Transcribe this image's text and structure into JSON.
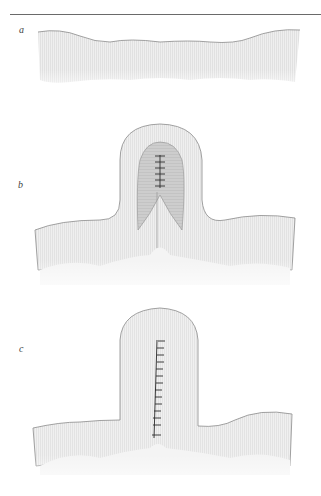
{
  "figure": {
    "panels": [
      {
        "label": "a",
        "description": "flat tissue layer"
      },
      {
        "label": "b",
        "description": "tissue folded upward into a loop with inner sutures"
      },
      {
        "label": "c",
        "description": "folded tissue closed with a vertical line of sutures"
      }
    ],
    "colors": {
      "tissue_fill": "#e9e9e9",
      "tissue_outline": "#8a8a8a",
      "inner_fill": "#c8c8c8",
      "suture": "#2a2a2a",
      "rule": "#6a6a6a"
    },
    "suture_counts": {
      "b": 6,
      "c": 14
    }
  }
}
